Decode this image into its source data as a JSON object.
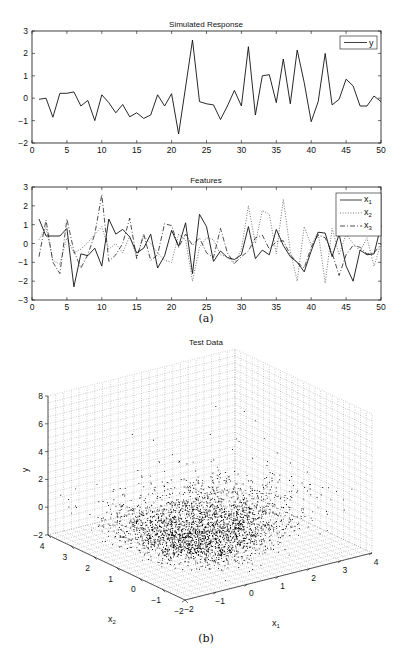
{
  "chart_data": [
    {
      "type": "line",
      "title": "Simulated Response",
      "xlabel": "",
      "ylabel": "",
      "xlim": [
        0,
        50
      ],
      "ylim": [
        -2,
        3
      ],
      "xticks": [
        0,
        5,
        10,
        15,
        20,
        25,
        30,
        35,
        40,
        45,
        50
      ],
      "yticks": [
        -2,
        -1,
        0,
        1,
        2,
        3
      ],
      "grid": false,
      "legend_position": "upper right",
      "x": [
        1,
        2,
        3,
        4,
        5,
        6,
        7,
        8,
        9,
        10,
        11,
        12,
        13,
        14,
        15,
        16,
        17,
        18,
        19,
        20,
        21,
        22,
        23,
        24,
        25,
        26,
        27,
        28,
        29,
        30,
        31,
        32,
        33,
        34,
        35,
        36,
        37,
        38,
        39,
        40,
        41,
        42,
        43,
        44,
        45,
        46,
        47,
        48,
        49,
        50
      ],
      "series": [
        {
          "name": "y",
          "style": "solid",
          "values": [
            -0.05,
            0.0,
            -0.85,
            0.22,
            0.22,
            0.28,
            -0.35,
            -0.1,
            -1.0,
            0.15,
            -0.2,
            -0.65,
            -0.28,
            -0.83,
            -0.65,
            -0.9,
            -0.75,
            0.15,
            -0.35,
            0.2,
            -1.6,
            0.5,
            2.6,
            -0.15,
            -0.25,
            -0.3,
            -0.95,
            -0.35,
            0.35,
            -0.35,
            2.3,
            -0.75,
            1.0,
            1.05,
            -0.2,
            1.75,
            -0.25,
            2.15,
            0.7,
            -1.05,
            -0.15,
            2.0,
            -0.3,
            -0.05,
            0.85,
            0.55,
            -0.35,
            -0.35,
            0.1,
            -0.15
          ]
        }
      ]
    },
    {
      "type": "line",
      "title": "Features",
      "xlabel": "",
      "ylabel": "",
      "xlim": [
        0,
        50
      ],
      "ylim": [
        -3,
        3
      ],
      "xticks": [
        0,
        5,
        10,
        15,
        20,
        25,
        30,
        35,
        40,
        45,
        50
      ],
      "yticks": [
        -3,
        -2,
        -1,
        0,
        1,
        2,
        3
      ],
      "grid": false,
      "legend_position": "upper right",
      "x": [
        1,
        2,
        3,
        4,
        5,
        6,
        7,
        8,
        9,
        10,
        11,
        12,
        13,
        14,
        15,
        16,
        17,
        18,
        19,
        20,
        21,
        22,
        23,
        24,
        25,
        26,
        27,
        28,
        29,
        30,
        31,
        32,
        33,
        34,
        35,
        36,
        37,
        38,
        39,
        40,
        41,
        42,
        43,
        44,
        45,
        46,
        47,
        48,
        49,
        50
      ],
      "series": [
        {
          "name": "x1",
          "style": "solid",
          "values": [
            1.3,
            0.4,
            0.4,
            0.4,
            0.8,
            -2.3,
            -0.55,
            -0.65,
            -0.25,
            -1.2,
            1.3,
            0.5,
            0.75,
            0.35,
            -0.5,
            -0.25,
            0.5,
            -1.3,
            -0.65,
            0.7,
            -0.15,
            1.1,
            -1.6,
            1.55,
            0.9,
            -0.95,
            -0.4,
            -0.75,
            -0.85,
            -0.6,
            0.9,
            -0.8,
            -0.35,
            -0.6,
            0.75,
            -0.1,
            -0.7,
            -1.0,
            -1.5,
            -0.4,
            0.6,
            0.55,
            -0.7,
            0.5,
            -1.2,
            -2.0,
            -0.35,
            -0.6,
            -0.55,
            0.95
          ]
        },
        {
          "name": "x2",
          "style": "dotted",
          "values": [
            0.2,
            0.85,
            -0.9,
            -1.1,
            0.3,
            -0.5,
            -0.3,
            0.05,
            0.5,
            0.9,
            -0.3,
            0.0,
            -0.5,
            0.4,
            -0.7,
            0.4,
            0.0,
            -0.5,
            -0.9,
            -1.0,
            0.5,
            0.2,
            -2.0,
            -0.2,
            0.3,
            0.2,
            -0.6,
            -0.7,
            -1.1,
            -0.3,
            2.0,
            0.0,
            1.75,
            1.55,
            -0.55,
            2.35,
            -0.4,
            -2.0,
            0.9,
            -0.1,
            0.6,
            -2.1,
            0.8,
            -0.6,
            0.5,
            0.0,
            -0.4,
            0.3,
            -1.2,
            0.0
          ]
        },
        {
          "name": "x3",
          "style": "dash-dot",
          "values": [
            -0.7,
            1.25,
            -1.0,
            -1.6,
            1.3,
            -0.4,
            -1.3,
            -0.6,
            0.5,
            2.6,
            -0.95,
            -0.6,
            0.0,
            1.35,
            -0.8,
            0.5,
            -0.9,
            -0.6,
            1.05,
            0.95,
            -0.2,
            0.5,
            -0.1,
            0.3,
            -0.5,
            -0.75,
            0.8,
            -0.5,
            -1.05,
            -0.7,
            -0.4,
            0.3,
            0.45,
            -0.3,
            0.1,
            0.15,
            -0.6,
            -1.0,
            -1.3,
            -0.2,
            0.45,
            0.3,
            -0.5,
            -1.7,
            -0.6,
            -0.1,
            -0.2,
            -0.55,
            -0.5,
            -0.05
          ]
        }
      ]
    },
    {
      "type": "scatter",
      "subtype": "scatter3d",
      "title": "Test Data",
      "xlabel": "x1",
      "ylabel": "x2",
      "zlabel": "y",
      "xlim": [
        -2,
        4
      ],
      "ylim": [
        -2,
        4
      ],
      "zlim": [
        -2,
        8
      ],
      "xticks": [
        -2,
        -1,
        0,
        1,
        2,
        3,
        4
      ],
      "yticks": [
        -2,
        -1,
        0,
        1,
        2,
        3,
        4
      ],
      "zticks": [
        -2,
        0,
        2,
        4,
        6,
        8
      ],
      "grid": true,
      "marker": "point",
      "color": "#000000",
      "description": "Dense V-shaped point cloud concentrated near y between -2 and 2 with valley along x1≈0, sparse outliers up to y≈7"
    }
  ],
  "captions": {
    "a": "(a)",
    "b": "(b)"
  },
  "legend1": {
    "y": "y"
  },
  "legend2": {
    "x1": "x",
    "x1_sub": "1",
    "x2": "x",
    "x2_sub": "2",
    "x3": "x",
    "x3_sub": "3"
  },
  "colors": {
    "line": "#111111",
    "dotted": "#777777",
    "grid": "#999999",
    "background": "#ffffff"
  }
}
